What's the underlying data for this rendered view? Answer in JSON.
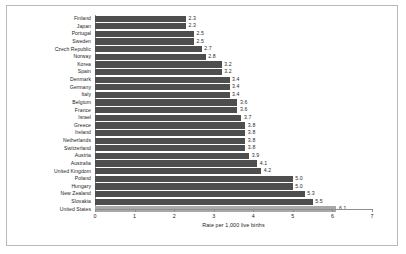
{
  "chart_data": {
    "type": "bar",
    "orientation": "horizontal",
    "title": "",
    "xlabel": "Rate per 1,000 live births",
    "ylabel": "",
    "xlim": [
      0,
      7
    ],
    "xticks": [
      0,
      1,
      2,
      3,
      4,
      5,
      6,
      7
    ],
    "grid": false,
    "legend": null,
    "bar_color": "#4e4e4e",
    "highlight_color": "#a8a8a8",
    "highlight_category": "United States",
    "categories": [
      "Finland",
      "Japan",
      "Portugal",
      "Sweden",
      "Czech Republic",
      "Norway",
      "Korea",
      "Spain",
      "Denmark",
      "Germany",
      "Italy",
      "Belgium",
      "France",
      "Israel",
      "Greece",
      "Ireland",
      "Netherlands",
      "Switzerland",
      "Austria",
      "Australia",
      "United Kingdom",
      "Poland",
      "Hungary",
      "New Zealand",
      "Slovakia",
      "United States"
    ],
    "values": [
      2.3,
      2.3,
      2.5,
      2.5,
      2.7,
      2.8,
      3.2,
      3.2,
      3.4,
      3.4,
      3.4,
      3.6,
      3.6,
      3.7,
      3.8,
      3.8,
      3.8,
      3.8,
      3.9,
      4.1,
      4.2,
      5.0,
      5.0,
      5.3,
      5.5,
      5.7
    ],
    "value_labels": [
      "2.3",
      "2.3",
      "2.5",
      "2.5",
      "2.7",
      "2.8",
      "3.2",
      "3.2",
      "3.4",
      "3.4",
      "3.4",
      "3.6",
      "3.6",
      "3.7",
      "3.8",
      "3.8",
      "3.8",
      "3.8",
      "3.9",
      "4.1",
      "4.2",
      "5.0",
      "5.0",
      "5.3",
      "5.5",
      "5.7"
    ],
    "highlight_value": 6.1,
    "highlight_value_label": "6.1"
  }
}
